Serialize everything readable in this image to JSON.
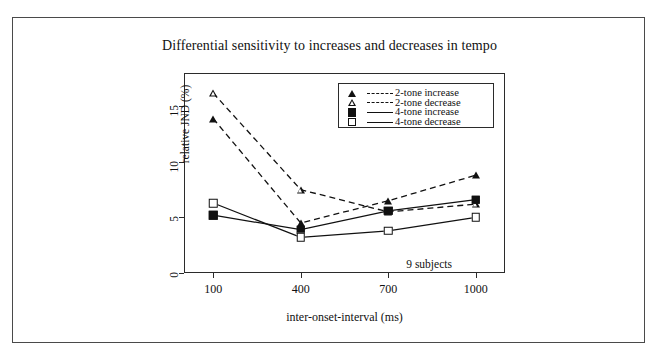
{
  "figure": {
    "title": "Differential sensitivity to increases and decreases in tempo",
    "annotation": "9 subjects"
  },
  "axes": {
    "xlabel": "inter-onset-interval (ms)",
    "ylabel": "relative JND (%)",
    "xticks": [
      "100",
      "400",
      "700",
      "1000"
    ],
    "yticks": [
      "0",
      "5",
      "10",
      "15"
    ]
  },
  "legend": {
    "entries": [
      {
        "label": "2-tone increase",
        "marker": "triangle-filled-icon",
        "line": "dashed"
      },
      {
        "label": "2-tone decrease",
        "marker": "triangle-open-icon",
        "line": "dashed"
      },
      {
        "label": "4-tone increase",
        "marker": "square-filled-icon",
        "line": "solid"
      },
      {
        "label": "4-tone decrease",
        "marker": "square-open-icon",
        "line": "solid"
      }
    ]
  },
  "chart_data": {
    "type": "line",
    "title": "Differential sensitivity to increases and decreases in tempo",
    "xlabel": "inter-onset-interval (ms)",
    "ylabel": "relative JND (%)",
    "x": [
      100,
      400,
      700,
      1000
    ],
    "xlim": [
      0,
      1100
    ],
    "ylim": [
      0,
      18
    ],
    "xticks": [
      100,
      400,
      700,
      1000
    ],
    "yticks": [
      0,
      5,
      10,
      15
    ],
    "grid": false,
    "legend_position": "top-right-inside",
    "annotations": [
      "9 subjects"
    ],
    "series": [
      {
        "name": "2-tone increase",
        "values": [
          13.9,
          4.5,
          6.5,
          8.8
        ],
        "marker": "triangle-filled",
        "linestyle": "dashed",
        "color": "#111111"
      },
      {
        "name": "2-tone decrease",
        "values": [
          16.2,
          7.5,
          5.5,
          6.2
        ],
        "marker": "triangle-open",
        "linestyle": "dashed",
        "color": "#111111"
      },
      {
        "name": "4-tone increase",
        "values": [
          5.2,
          3.9,
          5.6,
          6.6
        ],
        "marker": "square-filled",
        "linestyle": "solid",
        "color": "#111111"
      },
      {
        "name": "4-tone decrease",
        "values": [
          6.3,
          3.2,
          3.8,
          5.0
        ],
        "marker": "square-open",
        "linestyle": "solid",
        "color": "#111111"
      }
    ]
  }
}
